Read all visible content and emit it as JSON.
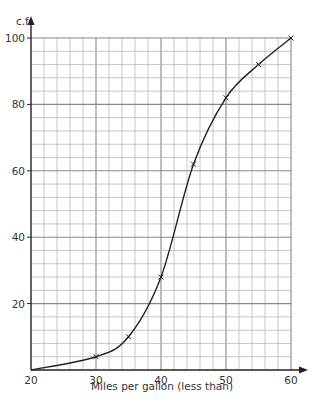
{
  "chart_data": {
    "type": "line",
    "title": "",
    "xlabel": "Miles per gallon (less than)",
    "ylabel": "c.f.",
    "x": [
      20,
      30,
      35,
      40,
      45,
      50,
      55,
      60
    ],
    "series": [
      {
        "name": "cumulative frequency",
        "values": [
          0,
          4,
          10,
          28,
          62,
          82,
          92,
          100
        ],
        "marker": "x",
        "curve": "smooth"
      }
    ],
    "xlim": [
      20,
      60
    ],
    "ylim": [
      0,
      100
    ],
    "x_ticks": [
      20,
      30,
      40,
      50,
      60
    ],
    "y_ticks": [
      20,
      40,
      60,
      80,
      100
    ],
    "x_minor_step": 2,
    "y_minor_step": 4,
    "grid": true,
    "legend": "none"
  },
  "labels": {
    "x_ticks": [
      "20",
      "30",
      "40",
      "50",
      "60"
    ],
    "y_ticks": [
      "20",
      "40",
      "60",
      "80",
      "100"
    ],
    "xlabel": "Miles per gallon (less than)",
    "ylabel": "c.f."
  },
  "colors": {
    "grid": "#b8b8b8",
    "axis": "#222222",
    "curve": "#222222",
    "text": "#333333"
  }
}
